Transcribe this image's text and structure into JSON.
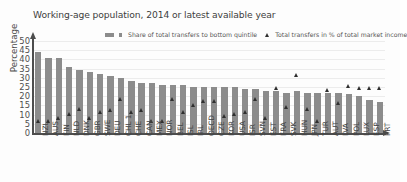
{
  "chart_data": {
    "type": "bar",
    "title": "Working-age population, 2014 or latest available year",
    "xlabel": "",
    "ylabel": "Percentage",
    "ylim": [
      0,
      50
    ],
    "yticks": [
      0,
      5,
      10,
      15,
      20,
      25,
      30,
      35,
      40,
      45,
      50
    ],
    "grid": true,
    "legend_position": "top-center",
    "categories": [
      "NZL",
      "AUS",
      "FIN",
      "NLD",
      "DNK",
      "GBR",
      "SWE",
      "DEU",
      "CHL 1",
      "CHE",
      "CAN",
      "MEX",
      "NOR",
      "BEL",
      "ISL",
      "IRL",
      "OECD",
      "CZE",
      "KOR",
      "USA",
      "ISR",
      "SVN",
      "EST",
      "FRA",
      "SVK",
      "HUN",
      "JPN",
      "TUR",
      "AUT",
      "LVA",
      "POL",
      "LUX",
      "ESP",
      "PRT"
    ],
    "series": [
      {
        "name": "Share of total transfers to bottom quintile",
        "type": "bar",
        "color": "#8c8c8c",
        "values": [
          44,
          41,
          41,
          36,
          34,
          33,
          32,
          31,
          30,
          28,
          27,
          27,
          26,
          26,
          26,
          25,
          25,
          25,
          25,
          25,
          24,
          24,
          23,
          23,
          22,
          23,
          22,
          22,
          22,
          22,
          21,
          20,
          18,
          17
        ]
      },
      {
        "name": "Total transfers in % of total market income",
        "type": "scatter",
        "color": "#2f2f2f",
        "values": [
          5,
          5,
          7,
          9,
          12,
          7,
          10,
          11,
          17,
          10,
          11,
          5,
          5,
          17,
          10,
          14,
          16,
          16,
          8,
          9,
          10,
          17,
          7,
          23,
          13,
          30,
          12,
          5,
          22,
          15,
          24,
          23,
          23,
          23
        ]
      }
    ]
  },
  "legend": {
    "series1_label": "Share of total transfers to bottom quintile",
    "series2_label": "Total transfers in % of total market income"
  }
}
